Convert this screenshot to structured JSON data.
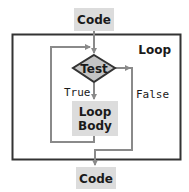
{
  "diagram": {
    "loop_container": {
      "label": "Loop"
    },
    "nodes": [
      {
        "id": "code_in",
        "shape": "rect",
        "label": "Code"
      },
      {
        "id": "test",
        "shape": "diamond",
        "label": "Test"
      },
      {
        "id": "body",
        "shape": "rect",
        "label_lines": [
          "Loop",
          "Body"
        ]
      },
      {
        "id": "code_out",
        "shape": "rect",
        "label": "Code"
      }
    ],
    "edges": [
      {
        "from": "code_in",
        "to": "test",
        "label": ""
      },
      {
        "from": "test",
        "to": "body",
        "label": "True"
      },
      {
        "from": "body",
        "to": "test",
        "label": ""
      },
      {
        "from": "test",
        "to": "code_out",
        "label": "False"
      }
    ],
    "colors": {
      "box_fill": "#dcdcdc",
      "diamond_fill": "#c4c4c4",
      "line": "#8a8a8a",
      "border": "#333333",
      "text": "#1a1a1a"
    }
  }
}
